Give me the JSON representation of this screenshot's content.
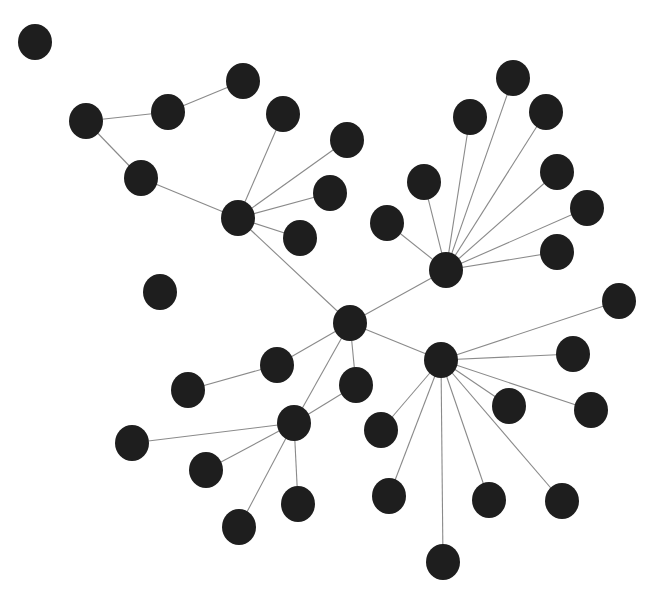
{
  "diagram": {
    "type": "network-graph",
    "canvas": {
      "width": 671,
      "height": 616
    },
    "style": {
      "background": "#ffffff",
      "node_fill": "#1e1e1e",
      "edge_color": "#8a8a8a",
      "edge_width": 1.1,
      "node_rx": 17,
      "node_ry": 18
    },
    "nodes": [
      {
        "id": 0,
        "x": 35,
        "y": 42
      },
      {
        "id": 1,
        "x": 86,
        "y": 121
      },
      {
        "id": 2,
        "x": 168,
        "y": 112
      },
      {
        "id": 3,
        "x": 243,
        "y": 81
      },
      {
        "id": 4,
        "x": 141,
        "y": 178
      },
      {
        "id": 5,
        "x": 238,
        "y": 218
      },
      {
        "id": 6,
        "x": 283,
        "y": 114
      },
      {
        "id": 7,
        "x": 347,
        "y": 140
      },
      {
        "id": 8,
        "x": 330,
        "y": 193
      },
      {
        "id": 9,
        "x": 300,
        "y": 238
      },
      {
        "id": 10,
        "x": 160,
        "y": 292
      },
      {
        "id": 11,
        "x": 350,
        "y": 323
      },
      {
        "id": 12,
        "x": 446,
        "y": 270
      },
      {
        "id": 13,
        "x": 387,
        "y": 223
      },
      {
        "id": 14,
        "x": 424,
        "y": 182
      },
      {
        "id": 15,
        "x": 470,
        "y": 117
      },
      {
        "id": 16,
        "x": 513,
        "y": 78
      },
      {
        "id": 17,
        "x": 546,
        "y": 112
      },
      {
        "id": 18,
        "x": 557,
        "y": 172
      },
      {
        "id": 19,
        "x": 587,
        "y": 208
      },
      {
        "id": 20,
        "x": 557,
        "y": 252
      },
      {
        "id": 21,
        "x": 441,
        "y": 360
      },
      {
        "id": 22,
        "x": 619,
        "y": 301
      },
      {
        "id": 23,
        "x": 573,
        "y": 354
      },
      {
        "id": 24,
        "x": 591,
        "y": 410
      },
      {
        "id": 25,
        "x": 509,
        "y": 406
      },
      {
        "id": 26,
        "x": 562,
        "y": 501
      },
      {
        "id": 27,
        "x": 489,
        "y": 500
      },
      {
        "id": 28,
        "x": 443,
        "y": 562
      },
      {
        "id": 29,
        "x": 389,
        "y": 496
      },
      {
        "id": 30,
        "x": 381,
        "y": 430
      },
      {
        "id": 31,
        "x": 356,
        "y": 385
      },
      {
        "id": 32,
        "x": 277,
        "y": 365
      },
      {
        "id": 33,
        "x": 188,
        "y": 390
      },
      {
        "id": 34,
        "x": 294,
        "y": 423
      },
      {
        "id": 35,
        "x": 132,
        "y": 443
      },
      {
        "id": 36,
        "x": 206,
        "y": 470
      },
      {
        "id": 37,
        "x": 239,
        "y": 527
      },
      {
        "id": 38,
        "x": 298,
        "y": 504
      }
    ],
    "edges": [
      [
        1,
        2
      ],
      [
        2,
        3
      ],
      [
        1,
        4
      ],
      [
        4,
        5
      ],
      [
        5,
        6
      ],
      [
        5,
        7
      ],
      [
        5,
        8
      ],
      [
        5,
        9
      ],
      [
        5,
        11
      ],
      [
        11,
        12
      ],
      [
        11,
        21
      ],
      [
        11,
        32
      ],
      [
        11,
        31
      ],
      [
        11,
        34
      ],
      [
        12,
        13
      ],
      [
        12,
        14
      ],
      [
        12,
        15
      ],
      [
        12,
        16
      ],
      [
        12,
        17
      ],
      [
        12,
        18
      ],
      [
        12,
        19
      ],
      [
        12,
        20
      ],
      [
        21,
        22
      ],
      [
        21,
        23
      ],
      [
        21,
        24
      ],
      [
        21,
        25
      ],
      [
        21,
        26
      ],
      [
        21,
        27
      ],
      [
        21,
        28
      ],
      [
        21,
        29
      ],
      [
        21,
        30
      ],
      [
        32,
        33
      ],
      [
        34,
        31
      ],
      [
        34,
        35
      ],
      [
        34,
        36
      ],
      [
        34,
        37
      ],
      [
        34,
        38
      ]
    ],
    "isolated_nodes": [
      0,
      10
    ],
    "hubs": [
      5,
      11,
      12,
      21,
      34
    ]
  }
}
